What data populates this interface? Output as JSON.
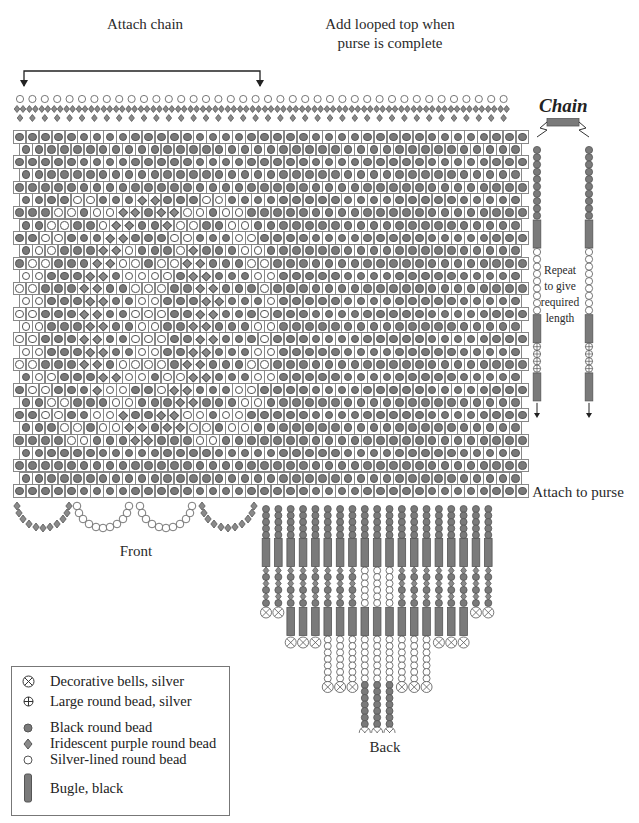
{
  "labels": {
    "attach_chain": "Attach chain",
    "looped_top_line1": "Add looped top when",
    "looped_top_line2": "purse is complete",
    "chain_title": "Chain",
    "repeat_line1": "Repeat",
    "repeat_line2": "to give",
    "repeat_line3": "required",
    "repeat_line4": "length",
    "attach_to_purse": "Attach to purse",
    "front": "Front",
    "back": "Back"
  },
  "legend": [
    {
      "symbol": "bell",
      "label": "Decorative bells, silver"
    },
    {
      "symbol": "large-silver",
      "label": "Large round bead, silver"
    },
    {
      "symbol": "black",
      "label": "Black round bead"
    },
    {
      "symbol": "purple",
      "label": "Iridescent purple round bead"
    },
    {
      "symbol": "silver-lined",
      "label": "Silver-lined round bead"
    },
    {
      "symbol": "bugle",
      "label": "Bugle, black"
    }
  ],
  "colors": {
    "black_bead": "#7a7a7a",
    "outline": "#555555",
    "grid_line": "#888888"
  },
  "grid": {
    "rows": 29,
    "long_row_cols": 40,
    "short_row_cols": 39,
    "pattern_rows": [
      "BBBBBBBBBBBBBBBBBBBB",
      "BBBBBBBBBBBBBBBBBBB",
      "BBBBBBBBBBBBBBBBBBBB",
      "BBBBBBBBBBBBBBBBBBB",
      "BBBBBBBBBBBBBBBBBBBB",
      "BBBBSSBBBDDBBBSSBBB",
      "BBBSSBSSDDBDDSSBSSBB",
      "BBSSBBSDDBBDSSBBSSB",
      "BBSSBBBDDBBBSSBBBSSB",
      "BSSBBBDDSBBBSDBBBSSB",
      "BSSBBBDDSSBSSDDBBBSS",
      "SSBBBDDBSSSSBDDBBBSS",
      "SSBBBDDBBSSSBBDDBBBS",
      "SSBBBDDBBSSBBBDDBBBS",
      "SSBBBDDBBSSSBBDDBBBS",
      "SSBBBDDBBSSBBDDBBBSS",
      "SSBBBDDBBSSSBBDDBBBS",
      "SSBBBDDBBSSBBDDBBBSS",
      "SSBBBDDBSSSSBDDBBBSS",
      "BSSBBBDDSSBSSDDBBBSS",
      "BSSBBBDSSBBSDDBBBSSB",
      "BBSSBBBSSBBBDDBBBSSB",
      "BBSSBBSSDBBDDSSBSSBB",
      "BBBSSBSSDDBDDSSBSSBB",
      "BBBBSSBBBDDBBBSSBBB",
      "BBBBBBBBBBBBBBBBBBBB",
      "BBBBBBBBBBBBBBBBBBB",
      "BBBBBBBBBBBBBBBBBBBB",
      "BBBBBBBBBBBBBBBBBBB"
    ]
  },
  "chain": {
    "sequence": [
      "black x10",
      "bugle",
      "silver-lined x8",
      "bugle",
      "large-silver x4",
      "bugle"
    ]
  },
  "back_fringe": {
    "strands": 19
  }
}
